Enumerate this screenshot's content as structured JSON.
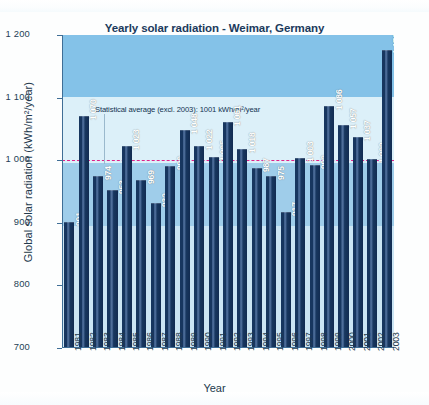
{
  "figure": {
    "title": "Yearly solar radiation - Weimar, Germany",
    "scan_artifact_text": "",
    "annotation": "Statistical average (excl. 2003): 1001 kWh/m²/year"
  },
  "colors": {
    "title": "#1b3a5c",
    "bar": "#17365f",
    "bar_highlight": "#51719c",
    "average_line": "#e0218a",
    "band_top": "#84c2e8",
    "band_upper": "#dcf0f9",
    "band_mid": "#9fcdea",
    "band_low": "#cbe5f4",
    "axis": "#3f6e96",
    "axis_text": "#22384c"
  },
  "chart_data": {
    "type": "bar",
    "title": "Yearly solar radiation - Weimar, Germany",
    "xlabel": "Year",
    "ylabel": "Global solar radiation (kWh/m²/year)",
    "ylim": [
      700,
      1200
    ],
    "yticks": [
      700,
      800,
      900,
      1000,
      1100,
      1200
    ],
    "ytick_labels": [
      "700",
      "800",
      "900",
      "1 000",
      "1 100",
      "1 200"
    ],
    "grid": false,
    "legend": null,
    "categories": [
      "1981",
      "1982",
      "1983",
      "1984",
      "1985",
      "1986",
      "1987",
      "1988",
      "1989",
      "1990",
      "1991",
      "1992",
      "1993",
      "1994",
      "1995",
      "1996",
      "1997",
      "1998",
      "1999",
      "2000",
      "2001",
      "2002",
      "2003"
    ],
    "values": [
      901,
      1070,
      974,
      953,
      1023,
      969,
      932,
      990,
      1048,
      1022,
      1005,
      1061,
      1018,
      987,
      975,
      917,
      1003,
      992,
      1086,
      1057,
      1037,
      1002,
      1176
    ],
    "value_labels": [
      "901",
      "1 070",
      "974",
      "953",
      "1 023",
      "969",
      "932",
      "990",
      "1 048",
      "1 022",
      "1 005",
      "1 061",
      "1 018",
      "987",
      "975",
      "917",
      "1 003",
      "992",
      "1 086",
      "1 057",
      "1 037",
      "1 002",
      "1 176"
    ],
    "annotations": [
      {
        "text": "Statistical average (excl. 2003): 1001 kWh/m²/year",
        "y": 1001,
        "line_style": "dashed",
        "line_color": "#e0218a"
      }
    ],
    "background_bands": [
      {
        "from": 1100,
        "to": 1200,
        "color": "#84c2e8"
      },
      {
        "from": 1000,
        "to": 1100,
        "color": "#dcf0f9"
      },
      {
        "from": 900,
        "to": 1000,
        "color": "#9fcdea"
      },
      {
        "from": 700,
        "to": 900,
        "color": "#cbe5f4"
      }
    ]
  }
}
